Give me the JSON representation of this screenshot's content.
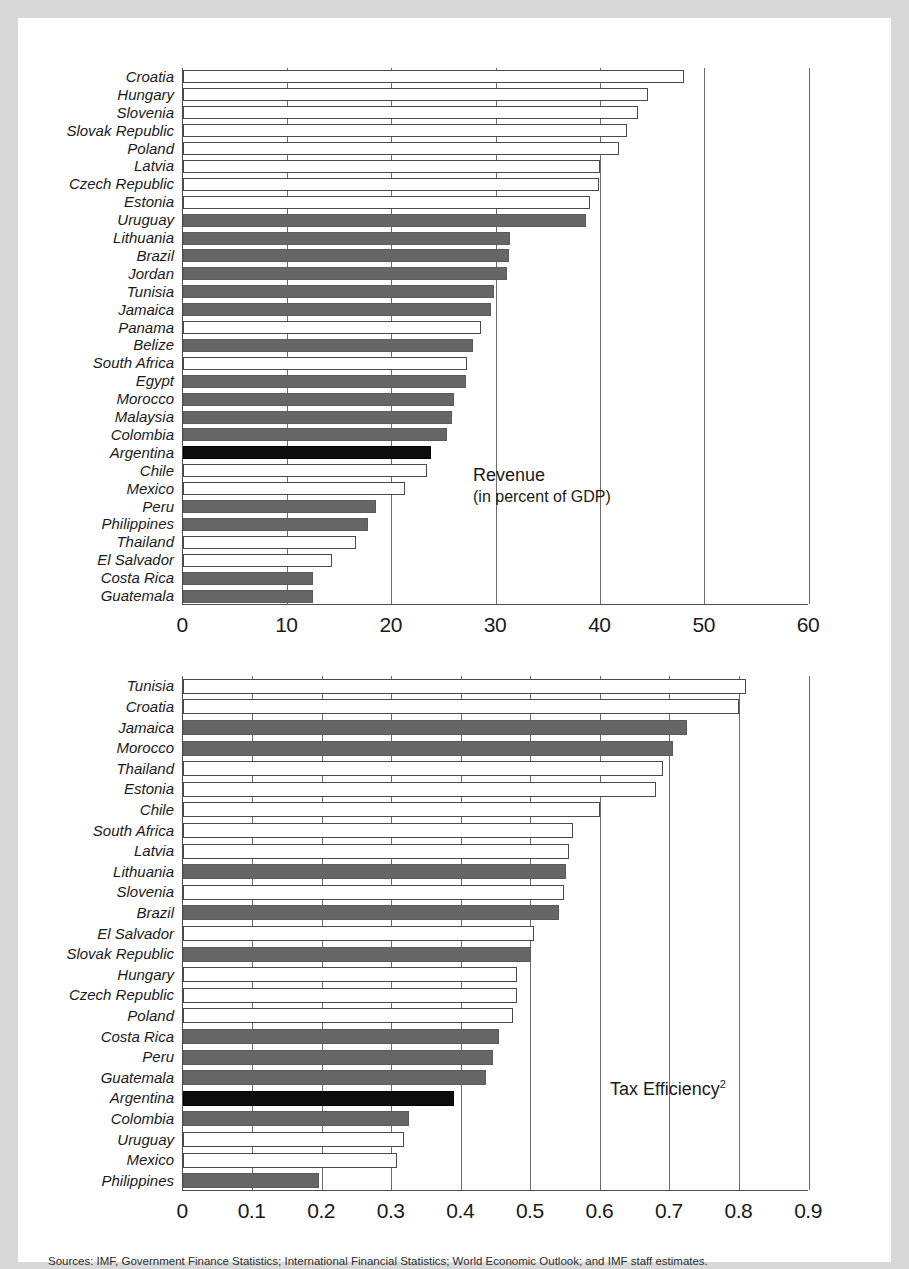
{
  "figure": {
    "background_color": "#d9d9d9",
    "panel_color": "#ffffff",
    "series_colors": {
      "open": "#ffffff",
      "gray": "#666666",
      "highlight": "#0d0d0d"
    },
    "source_note": "Sources: IMF, Government Finance Statistics; International Financial Statistics; World Economic Outlook; and IMF staff estimates."
  },
  "chart_data": [
    {
      "id": "revenue",
      "type": "bar",
      "orientation": "horizontal",
      "title": "Revenue",
      "subtitle": "(in percent of GDP)",
      "legend_position": "inside-right",
      "xlabel": "",
      "ylabel": "",
      "xlim": [
        0,
        60
      ],
      "xticks": [
        0,
        10,
        20,
        30,
        40,
        50,
        60
      ],
      "xtick_labels": [
        "0",
        "10",
        "20",
        "30",
        "40",
        "50",
        "60"
      ],
      "grid": true,
      "categories": [
        "Croatia",
        "Hungary",
        "Slovenia",
        "Slovak Republic",
        "Poland",
        "Latvia",
        "Czech Republic",
        "Estonia",
        "Uruguay",
        "Lithuania",
        "Brazil",
        "Jordan",
        "Tunisia",
        "Jamaica",
        "Panama",
        "Belize",
        "South Africa",
        "Egypt",
        "Morocco",
        "Malaysia",
        "Colombia",
        "Argentina",
        "Chile",
        "Mexico",
        "Peru",
        "Philippines",
        "Thailand",
        "El Salvador",
        "Costa Rica",
        "Guatemala"
      ],
      "values": [
        48.0,
        44.6,
        43.6,
        42.6,
        41.8,
        40.0,
        39.9,
        39.0,
        38.6,
        31.3,
        31.2,
        31.1,
        29.8,
        29.5,
        28.6,
        27.8,
        27.2,
        27.1,
        26.0,
        25.8,
        25.3,
        23.8,
        23.4,
        21.3,
        18.5,
        17.7,
        16.6,
        14.3,
        12.5,
        12.5
      ],
      "bar_styles": [
        "open",
        "open",
        "open",
        "open",
        "open",
        "open",
        "open",
        "open",
        "gray",
        "gray",
        "gray",
        "gray",
        "gray",
        "gray",
        "open",
        "gray",
        "open",
        "gray",
        "gray",
        "gray",
        "gray",
        "black",
        "open",
        "open",
        "gray",
        "gray",
        "open",
        "open",
        "gray",
        "gray"
      ]
    },
    {
      "id": "tax-efficiency",
      "type": "bar",
      "orientation": "horizontal",
      "title": "Tax Efficiency",
      "title_superscript": "2",
      "subtitle": "",
      "legend_position": "inside-right",
      "xlabel": "",
      "ylabel": "",
      "xlim": [
        0,
        0.9
      ],
      "xticks": [
        0,
        0.1,
        0.2,
        0.3,
        0.4,
        0.5,
        0.6,
        0.7,
        0.8,
        0.9
      ],
      "xtick_labels": [
        "0",
        "0.1",
        "0.2",
        "0.3",
        "0.4",
        "0.5",
        "0.6",
        "0.7",
        "0.8",
        "0.9"
      ],
      "grid": true,
      "categories": [
        "Tunisia",
        "Croatia",
        "Jamaica",
        "Morocco",
        "Thailand",
        "Estonia",
        "Chile",
        "South Africa",
        "Latvia",
        "Lithuania",
        "Slovenia",
        "Brazil",
        "El Salvador",
        "Slovak Republic",
        "Hungary",
        "Czech Republic",
        "Poland",
        "Costa Rica",
        "Peru",
        "Guatemala",
        "Argentina",
        "Colombia",
        "Uruguay",
        "Mexico",
        "Philippines"
      ],
      "values": [
        0.81,
        0.8,
        0.725,
        0.705,
        0.69,
        0.68,
        0.6,
        0.56,
        0.555,
        0.55,
        0.548,
        0.54,
        0.505,
        0.5,
        0.48,
        0.48,
        0.475,
        0.455,
        0.445,
        0.435,
        0.39,
        0.325,
        0.318,
        0.308,
        0.195
      ],
      "bar_styles": [
        "open",
        "open",
        "gray",
        "gray",
        "open",
        "open",
        "open",
        "open",
        "open",
        "gray",
        "open",
        "gray",
        "open",
        "gray",
        "open",
        "open",
        "open",
        "gray",
        "gray",
        "gray",
        "black",
        "gray",
        "open",
        "open",
        "gray"
      ]
    }
  ]
}
